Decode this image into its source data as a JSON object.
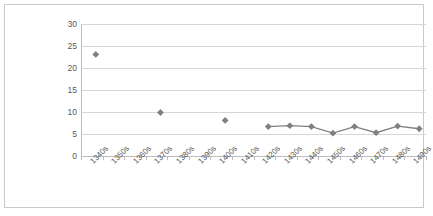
{
  "chart_data": {
    "type": "line",
    "title": "",
    "subtitle": "",
    "xlabel": "",
    "ylabel": "",
    "categories": [
      "1340s",
      "1350s",
      "1360s",
      "1370s",
      "1380s",
      "1390s",
      "1400s",
      "1410s",
      "1420s",
      "1430s",
      "1440s",
      "1450s",
      "1460s",
      "1470s",
      "1480s",
      "1490s"
    ],
    "values": [
      24,
      null,
      null,
      10.8,
      null,
      null,
      9,
      null,
      7.6,
      7.8,
      7.6,
      6.1,
      7.6,
      6.2,
      7.7,
      7.1
    ],
    "series": [
      {
        "name": "Series 1",
        "values": [
          24,
          null,
          null,
          10.8,
          null,
          null,
          9,
          null,
          7.6,
          7.8,
          7.6,
          6.1,
          7.6,
          6.2,
          7.7,
          7.1
        ]
      }
    ],
    "ylim": [
      0,
      30
    ],
    "y_ticks": [
      0,
      5,
      10,
      15,
      20,
      25,
      30
    ],
    "y_tick_labels": [
      "0",
      "5",
      "10",
      "15",
      "20",
      "25",
      "30"
    ],
    "grid": "horizontal",
    "legend": "none",
    "marker": "diamond",
    "series_color": "#808080",
    "gridline_color": "#d6d6d6",
    "axis_color": "#bdbdbd",
    "label_color": "#595959",
    "plot_background": "#ffffff",
    "x_tick_label_rotation": -45
  }
}
